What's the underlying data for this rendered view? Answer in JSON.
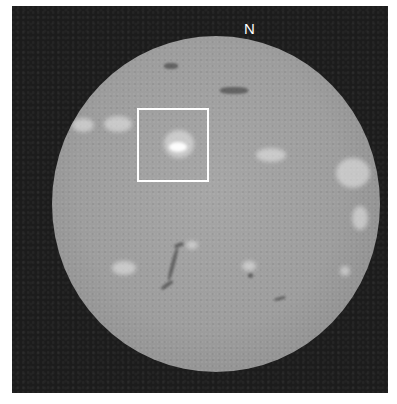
{
  "image": {
    "subject": "Full-disk solar image (H-alpha) with highlighted active region",
    "orientation_label": "N",
    "highlight_box": {
      "description": "Region of interest around bright active region",
      "color": "#ffffff"
    },
    "colors": {
      "background_frame": "#1c1c1c",
      "solar_disk": "#9d9d9d",
      "plage": "#ebebeb",
      "filament": "#323232"
    },
    "features": {
      "plages": [
        "northeast limb cluster",
        "boxed active region",
        "central-west plage",
        "west limb cluster",
        "southern scattered plages"
      ],
      "filaments": [
        "north polar filament",
        "northern filament",
        "southern curved filament",
        "southeast small filament"
      ]
    }
  }
}
